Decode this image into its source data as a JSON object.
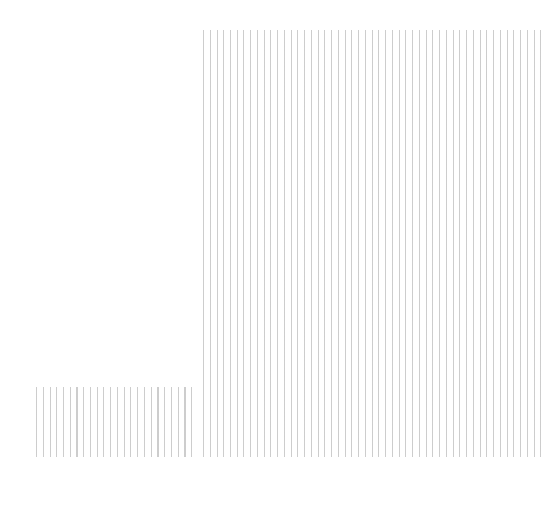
{
  "pattern": {
    "description": "Vertical thin gray line hatching in an L-shaped region",
    "line_color": "#c4c4c4",
    "background_color": "#ffffff",
    "blocks": [
      {
        "name": "right-block",
        "x": 203,
        "y": 30,
        "width": 338,
        "height": 427
      },
      {
        "name": "left-block",
        "x": 36,
        "y": 387,
        "width": 162,
        "height": 70
      }
    ]
  }
}
